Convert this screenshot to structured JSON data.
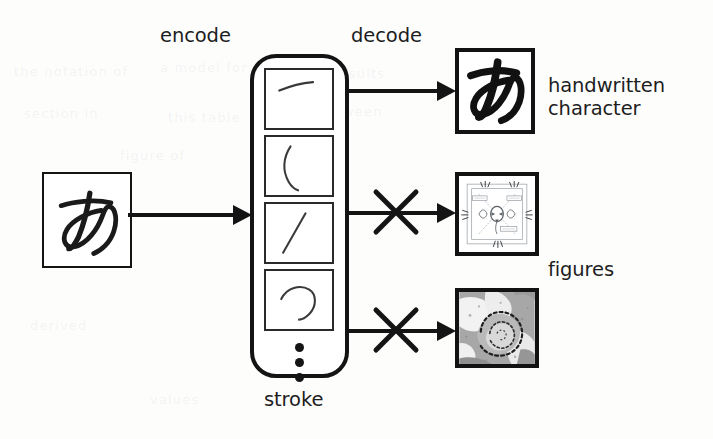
{
  "figure": {
    "kind": "encoder-decoder-diagram",
    "background_color": "#fdfdfc",
    "ink_color": "#141414"
  },
  "labels": {
    "encode": "encode",
    "decode": "decode",
    "stroke": "stroke",
    "handwritten_character": "handwritten\ncharacter",
    "figures": "figures"
  },
  "input": {
    "name": "input-handwritten-character",
    "glyph": "あ",
    "description": "handwritten hiragana a"
  },
  "latent": {
    "name": "stroke-sequence",
    "label": "stroke",
    "ellipsis": "⋮",
    "items": [
      {
        "id": "stroke-1",
        "description": "short diagonal dash, upper-left to right"
      },
      {
        "id": "stroke-2",
        "description": "long curved vertical hook"
      },
      {
        "id": "stroke-3",
        "description": "slanted descending stroke"
      },
      {
        "id": "stroke-4",
        "description": "open loop curve"
      }
    ]
  },
  "outputs": [
    {
      "id": "output-handwritten-character",
      "label": "handwritten\ncharacter",
      "glyph": "あ",
      "kind": "handwritten-character",
      "blocked": false,
      "decode_marker": ""
    },
    {
      "id": "output-schematic-figure",
      "label": "figures",
      "kind": "schematic-diagram",
      "blocked": true,
      "decode_marker": "✕"
    },
    {
      "id": "output-satellite-figure",
      "label": "figures",
      "kind": "grayscale-satellite-image",
      "blocked": true,
      "decode_marker": "✕"
    }
  ],
  "arrows": [
    {
      "id": "arrow-encode",
      "from": "input-handwritten-character",
      "to": "stroke-sequence",
      "blocked": false
    },
    {
      "id": "arrow-decode-character",
      "from": "stroke-sequence",
      "to": "output-handwritten-character",
      "blocked": false
    },
    {
      "id": "arrow-decode-schematic",
      "from": "stroke-sequence",
      "to": "output-schematic-figure",
      "blocked": true
    },
    {
      "id": "arrow-decode-satellite",
      "from": "stroke-sequence",
      "to": "output-satellite-figure",
      "blocked": true
    }
  ],
  "bleed_text": {
    "lines": [
      "the notation of",
      "a model for",
      "and results",
      "section in",
      "this table",
      "between",
      "figure of",
      "derived",
      "values"
    ]
  }
}
